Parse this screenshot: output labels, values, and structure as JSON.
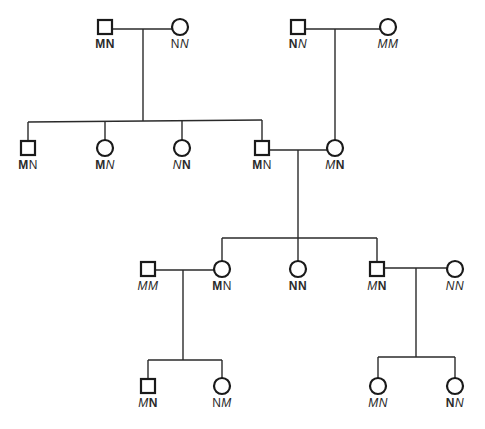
{
  "diagram": {
    "type": "pedigree",
    "legend": {
      "square": "male",
      "circle": "female"
    },
    "individuals": [
      {
        "id": "I1",
        "sex": "male",
        "x": 105,
        "y": 27,
        "genotype": [
          {
            "t": "M",
            "s": "b"
          },
          {
            "t": "N",
            "s": "b"
          }
        ]
      },
      {
        "id": "I2",
        "sex": "female",
        "x": 180,
        "y": 27,
        "genotype": [
          {
            "t": "N",
            "s": "r"
          },
          {
            "t": "N",
            "s": "i"
          }
        ]
      },
      {
        "id": "I3",
        "sex": "male",
        "x": 298,
        "y": 27,
        "genotype": [
          {
            "t": "N",
            "s": "b"
          },
          {
            "t": "N",
            "s": "i"
          }
        ]
      },
      {
        "id": "I4",
        "sex": "female",
        "x": 388,
        "y": 27,
        "genotype": [
          {
            "t": "M",
            "s": "i"
          },
          {
            "t": "M",
            "s": "i"
          }
        ]
      },
      {
        "id": "II1",
        "sex": "male",
        "x": 28,
        "y": 148,
        "genotype": [
          {
            "t": "M",
            "s": "b"
          },
          {
            "t": "N",
            "s": "r"
          }
        ]
      },
      {
        "id": "II2",
        "sex": "female",
        "x": 105,
        "y": 148,
        "genotype": [
          {
            "t": "M",
            "s": "b"
          },
          {
            "t": "N",
            "s": "i"
          }
        ]
      },
      {
        "id": "II3",
        "sex": "female",
        "x": 182,
        "y": 148,
        "genotype": [
          {
            "t": "N",
            "s": "i"
          },
          {
            "t": "N",
            "s": "b"
          }
        ]
      },
      {
        "id": "II4",
        "sex": "male",
        "x": 262,
        "y": 148,
        "genotype": [
          {
            "t": "M",
            "s": "b"
          },
          {
            "t": "N",
            "s": "r"
          }
        ]
      },
      {
        "id": "II5",
        "sex": "female",
        "x": 335,
        "y": 148,
        "genotype": [
          {
            "t": "M",
            "s": "i"
          },
          {
            "t": "N",
            "s": "b"
          }
        ]
      },
      {
        "id": "III1",
        "sex": "male",
        "x": 148,
        "y": 269,
        "genotype": [
          {
            "t": "M",
            "s": "i"
          },
          {
            "t": "M",
            "s": "i"
          }
        ]
      },
      {
        "id": "III2",
        "sex": "female",
        "x": 222,
        "y": 269,
        "genotype": [
          {
            "t": "M",
            "s": "b"
          },
          {
            "t": "N",
            "s": "r"
          }
        ]
      },
      {
        "id": "III3",
        "sex": "female",
        "x": 298,
        "y": 269,
        "genotype": [
          {
            "t": "N",
            "s": "b"
          },
          {
            "t": "N",
            "s": "b"
          }
        ]
      },
      {
        "id": "III4",
        "sex": "male",
        "x": 377,
        "y": 269,
        "genotype": [
          {
            "t": "M",
            "s": "i"
          },
          {
            "t": "N",
            "s": "b"
          }
        ]
      },
      {
        "id": "III5",
        "sex": "female",
        "x": 455,
        "y": 269,
        "genotype": [
          {
            "t": "N",
            "s": "i"
          },
          {
            "t": "N",
            "s": "i"
          }
        ]
      },
      {
        "id": "IV1",
        "sex": "male",
        "x": 148,
        "y": 386,
        "genotype": [
          {
            "t": "M",
            "s": "i"
          },
          {
            "t": "N",
            "s": "b"
          }
        ]
      },
      {
        "id": "IV2",
        "sex": "female",
        "x": 222,
        "y": 386,
        "genotype": [
          {
            "t": "N",
            "s": "r"
          },
          {
            "t": "M",
            "s": "i"
          }
        ]
      },
      {
        "id": "IV3",
        "sex": "female",
        "x": 378,
        "y": 386,
        "genotype": [
          {
            "t": "M",
            "s": "i"
          },
          {
            "t": "N",
            "s": "i"
          }
        ]
      },
      {
        "id": "IV4",
        "sex": "female",
        "x": 455,
        "y": 386,
        "genotype": [
          {
            "t": "N",
            "s": "b"
          },
          {
            "t": "N",
            "s": "i"
          }
        ]
      }
    ],
    "lines": [
      {
        "x1": 112,
        "y1": 29,
        "x2": 172,
        "y2": 29
      },
      {
        "x1": 143,
        "y1": 29,
        "x2": 143,
        "y2": 121
      },
      {
        "x1": 28,
        "y1": 122,
        "x2": 262,
        "y2": 120
      },
      {
        "x1": 28,
        "y1": 122,
        "x2": 28,
        "y2": 141
      },
      {
        "x1": 105,
        "y1": 121,
        "x2": 105,
        "y2": 140
      },
      {
        "x1": 182,
        "y1": 121,
        "x2": 182,
        "y2": 140
      },
      {
        "x1": 262,
        "y1": 120,
        "x2": 262,
        "y2": 141
      },
      {
        "x1": 305,
        "y1": 29,
        "x2": 380,
        "y2": 29
      },
      {
        "x1": 335,
        "y1": 29,
        "x2": 335,
        "y2": 140
      },
      {
        "x1": 269,
        "y1": 150,
        "x2": 327,
        "y2": 150
      },
      {
        "x1": 298,
        "y1": 150,
        "x2": 298,
        "y2": 238
      },
      {
        "x1": 222,
        "y1": 238,
        "x2": 377,
        "y2": 238
      },
      {
        "x1": 222,
        "y1": 238,
        "x2": 222,
        "y2": 261
      },
      {
        "x1": 298,
        "y1": 238,
        "x2": 298,
        "y2": 261
      },
      {
        "x1": 377,
        "y1": 238,
        "x2": 377,
        "y2": 262
      },
      {
        "x1": 155,
        "y1": 270,
        "x2": 214,
        "y2": 270
      },
      {
        "x1": 183,
        "y1": 270,
        "x2": 183,
        "y2": 360
      },
      {
        "x1": 148,
        "y1": 360,
        "x2": 222,
        "y2": 360
      },
      {
        "x1": 148,
        "y1": 360,
        "x2": 148,
        "y2": 379
      },
      {
        "x1": 222,
        "y1": 360,
        "x2": 222,
        "y2": 378
      },
      {
        "x1": 384,
        "y1": 268,
        "x2": 447,
        "y2": 268
      },
      {
        "x1": 416,
        "y1": 268,
        "x2": 416,
        "y2": 357
      },
      {
        "x1": 378,
        "y1": 357,
        "x2": 455,
        "y2": 357
      },
      {
        "x1": 378,
        "y1": 357,
        "x2": 378,
        "y2": 378
      },
      {
        "x1": 455,
        "y1": 357,
        "x2": 455,
        "y2": 378
      }
    ]
  },
  "labels": {
    "I1": "MN",
    "I2": "NN",
    "I3": "NN",
    "I4": "MM",
    "II1": "MN",
    "II2": "MN",
    "II3": "NN",
    "II4": "MN",
    "II5": "MN",
    "III1": "MM",
    "III2": "MN",
    "III3": "NN",
    "III4": "MN",
    "III5": "NN",
    "IV1": "MN",
    "IV2": "NM",
    "IV3": "MN",
    "IV4": "NN"
  }
}
